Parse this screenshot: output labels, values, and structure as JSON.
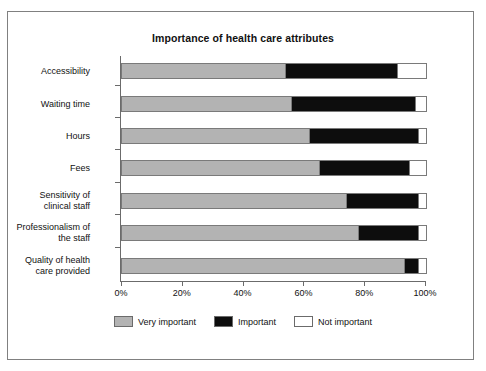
{
  "chart_data": {
    "type": "bar",
    "orientation": "horizontal",
    "stacked": true,
    "stack_mode": "percent",
    "title": "Importance of health care attributes",
    "xlabel": "",
    "ylabel": "",
    "xlim": [
      0,
      100
    ],
    "xticks": [
      "0%",
      "20%",
      "40%",
      "60%",
      "80%",
      "100%"
    ],
    "xtick_values": [
      0,
      20,
      40,
      60,
      80,
      100
    ],
    "grid": false,
    "legend_position": "bottom",
    "categories": [
      "Accessibility",
      "Waiting time",
      "Hours",
      "Fees",
      "Sensitivity of\nclinical staff",
      "Professionalism of\nthe staff",
      "Quality of health\ncare provided"
    ],
    "series": [
      {
        "name": "Very important",
        "color": "#b3b3b3",
        "values": [
          54,
          56,
          62,
          65,
          74,
          78,
          93
        ]
      },
      {
        "name": "Important",
        "color": "#0d0d0d",
        "values": [
          37,
          41,
          36,
          30,
          24,
          20,
          5
        ]
      },
      {
        "name": "Not important",
        "color": "#ffffff",
        "values": [
          9,
          3,
          2,
          5,
          2,
          2,
          2
        ]
      }
    ]
  },
  "figure": {
    "title": "Importance of health care attributes",
    "frame_color": "#808080",
    "axis_color": "#6b6b6b"
  },
  "legend": {
    "items": [
      {
        "label": "Very important"
      },
      {
        "label": "Important"
      },
      {
        "label": "Not important"
      }
    ]
  }
}
